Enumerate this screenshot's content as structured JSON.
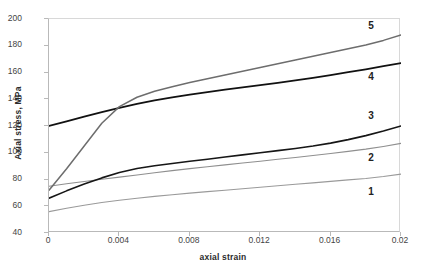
{
  "chart_data": {
    "type": "line",
    "title": "",
    "xlabel": "axial strain",
    "ylabel": "Axial stress, MPa",
    "xlim": [
      0,
      0.02
    ],
    "ylim": [
      40,
      200
    ],
    "xticks": [
      "0",
      "0.004",
      "0.008",
      "0.012",
      "0.016",
      "0.02"
    ],
    "xtick_values": [
      0,
      0.004,
      0.008,
      0.012,
      0.016,
      0.02
    ],
    "yticks": [
      "40",
      "60",
      "80",
      "100",
      "120",
      "140",
      "160",
      "180",
      "200"
    ],
    "ytick_values": [
      40,
      60,
      80,
      100,
      120,
      140,
      160,
      180,
      200
    ],
    "grid": false,
    "legend": "inline-end-labels",
    "x": [
      0,
      0.001,
      0.002,
      0.003,
      0.004,
      0.005,
      0.006,
      0.007,
      0.008,
      0.009,
      0.01,
      0.011,
      0.012,
      0.013,
      0.014,
      0.015,
      0.016,
      0.017,
      0.018,
      0.019,
      0.02
    ],
    "series": [
      {
        "name": "1",
        "label": "1",
        "color": "#9a9a9a",
        "width": 1.1,
        "values": [
          56,
          58.5,
          60.8,
          62.8,
          64.5,
          66.0,
          67.4,
          68.6,
          69.8,
          70.9,
          72.0,
          73.1,
          74.2,
          75.3,
          76.4,
          77.5,
          78.6,
          79.7,
          80.8,
          82.2,
          84.0
        ]
      },
      {
        "name": "2",
        "label": "2",
        "color": "#8f8f8f",
        "width": 1.1,
        "values": [
          75,
          76.8,
          78.5,
          80.2,
          81.8,
          83.4,
          85.0,
          86.6,
          88.1,
          89.5,
          90.9,
          92.3,
          93.7,
          95.1,
          96.5,
          97.9,
          99.4,
          101.0,
          102.7,
          104.7,
          107.0
        ]
      },
      {
        "name": "3",
        "label": "3",
        "color": "#161616",
        "width": 1.6,
        "values": [
          66,
          71.5,
          76.6,
          81.2,
          85.2,
          88.2,
          90.3,
          92.0,
          93.6,
          95.2,
          96.8,
          98.4,
          100.0,
          101.6,
          103.2,
          105.0,
          107.2,
          109.8,
          112.8,
          116.2,
          120.0
        ]
      },
      {
        "name": "4",
        "label": "4",
        "color": "#111111",
        "width": 1.8,
        "values": [
          120,
          123.5,
          127.0,
          130.4,
          133.6,
          136.5,
          139.1,
          141.4,
          143.5,
          145.4,
          147.2,
          148.9,
          150.6,
          152.3,
          154.1,
          156.0,
          158.0,
          160.2,
          162.4,
          164.7,
          167.0
        ]
      },
      {
        "name": "5",
        "label": "5",
        "color": "#6d6d6d",
        "width": 1.5,
        "values": [
          72,
          88.0,
          105.0,
          122.0,
          134.5,
          141.5,
          146.0,
          149.4,
          152.5,
          155.4,
          158.2,
          161.0,
          163.8,
          166.6,
          169.4,
          172.2,
          175.0,
          177.8,
          180.6,
          184.0,
          188.0
        ]
      }
    ],
    "series_label_positions": [
      {
        "label": "1",
        "x": 0.0182,
        "y": 70
      },
      {
        "label": "2",
        "x": 0.0182,
        "y": 95
      },
      {
        "label": "3",
        "x": 0.0182,
        "y": 127
      },
      {
        "label": "4",
        "x": 0.0182,
        "y": 156
      },
      {
        "label": "5",
        "x": 0.0182,
        "y": 194
      }
    ]
  }
}
